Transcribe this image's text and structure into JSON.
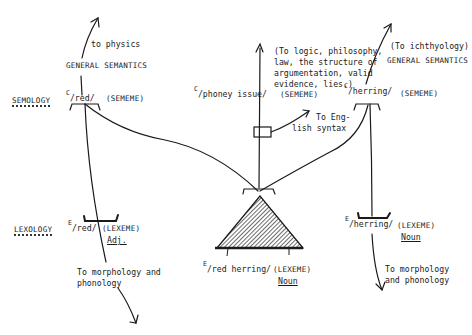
{
  "diagram": {
    "type": "stratificational grammar network",
    "colors": {
      "ink": "#1a1a1a",
      "background": "#ffffff"
    },
    "strata": {
      "semology": "SEMOLOGY",
      "lexology": "LEXOLOGY"
    },
    "left_column": {
      "upper_arrow_label": "to physics",
      "general_semantics": "GENERAL SEMANTICS",
      "sememe": {
        "prefix": "C",
        "form": "/red/",
        "tag": "(SEMEME)"
      },
      "lexeme": {
        "prefix": "E",
        "form": "/red/",
        "tag": "(LEXEME)",
        "class": "Adj."
      },
      "lower_arrow_label_line1": "To morphology and",
      "lower_arrow_label_line2": "phonology"
    },
    "center_column": {
      "upper_note_lines": [
        "(To logic, philosophy,",
        "law, the structure of",
        "argumentation, valid",
        "evidence, lies.)"
      ],
      "sememe": {
        "prefix": "C",
        "form": "/phoney issue/",
        "tag": "(SEMEME)"
      },
      "syntax_note_line1": "To Eng-",
      "syntax_note_line2": "lish syntax",
      "lexeme": {
        "prefix": "E",
        "form": "/red herring/",
        "tag": "(LEXEME)",
        "class": "Noun"
      }
    },
    "right_column": {
      "upper_note": "(To ichthyology)",
      "general_semantics": "GENERAL SEMANTICS",
      "sememe": {
        "prefix": "C",
        "form": "/herring/",
        "tag": "(SEMEME)"
      },
      "lexeme": {
        "prefix": "E",
        "form": "/herring/",
        "tag": "(LEXEME)",
        "class": "Noun"
      },
      "lower_arrow_label_line1": "To morphology",
      "lower_arrow_label_line2": "and phonology"
    }
  }
}
